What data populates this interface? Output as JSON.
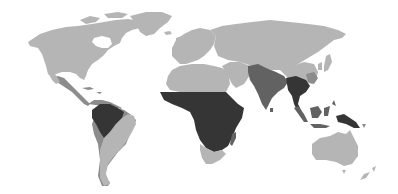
{
  "map": {
    "type": "choropleth-world-map",
    "colors": {
      "background": "#ffffff",
      "level_low": "#b5b5b5",
      "level_medium": "#8c8c8c",
      "level_high": "#626262",
      "level_very_high": "#353535",
      "border": "#a8a8a8"
    },
    "regions": [
      {
        "name": "north-america",
        "level": "low"
      },
      {
        "name": "greenland",
        "level": "low"
      },
      {
        "name": "mexico-central-america",
        "level": "medium"
      },
      {
        "name": "caribbean",
        "level": "medium"
      },
      {
        "name": "northern-south-america",
        "level": "medium"
      },
      {
        "name": "amazon-basin",
        "level": "very_high"
      },
      {
        "name": "southern-south-america",
        "level": "low"
      },
      {
        "name": "europe",
        "level": "low"
      },
      {
        "name": "north-africa",
        "level": "low"
      },
      {
        "name": "sub-saharan-africa",
        "level": "very_high"
      },
      {
        "name": "southern-africa",
        "level": "low"
      },
      {
        "name": "madagascar",
        "level": "high"
      },
      {
        "name": "middle-east",
        "level": "low"
      },
      {
        "name": "russia-central-asia",
        "level": "low"
      },
      {
        "name": "south-asia",
        "level": "high"
      },
      {
        "name": "southeast-asia-mainland",
        "level": "very_high"
      },
      {
        "name": "china",
        "level": "low"
      },
      {
        "name": "southern-china",
        "level": "medium"
      },
      {
        "name": "japan",
        "level": "low"
      },
      {
        "name": "indonesia-malaysia",
        "level": "high"
      },
      {
        "name": "new-guinea",
        "level": "very_high"
      },
      {
        "name": "australia",
        "level": "low"
      },
      {
        "name": "new-zealand",
        "level": "low"
      }
    ]
  }
}
